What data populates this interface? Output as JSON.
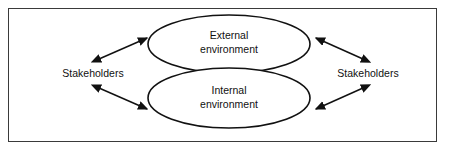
{
  "figure": {
    "background_color": "#ffffff",
    "frame_color": "#3a3a3a",
    "stroke_color": "#111111"
  },
  "diagram": {
    "type": "venn-overlap-with-bidirectional-arrows",
    "ellipses": [
      {
        "id": "external",
        "label_line1": "External",
        "label_line2": "environment",
        "cx": 229,
        "cy": 44,
        "rx": 81,
        "ry": 29
      },
      {
        "id": "internal",
        "label_line1": "Internal",
        "label_line2": "environment",
        "cx": 229,
        "cy": 98,
        "rx": 81,
        "ry": 30
      }
    ],
    "side_labels": [
      {
        "id": "stakeholders-left",
        "text": "Stakeholders",
        "x": 93,
        "y": 74
      },
      {
        "id": "stakeholders-right",
        "text": "Stakeholders",
        "x": 368,
        "y": 74
      }
    ],
    "arrows": [
      {
        "id": "left-upper",
        "x1": 99,
        "y1": 59,
        "x2": 147,
        "y2": 38,
        "double_headed": true
      },
      {
        "id": "left-lower",
        "x1": 99,
        "y1": 88,
        "x2": 147,
        "y2": 109,
        "double_headed": true
      },
      {
        "id": "right-upper",
        "x1": 363,
        "y1": 59,
        "x2": 316,
        "y2": 38,
        "double_headed": true
      },
      {
        "id": "right-lower",
        "x1": 363,
        "y1": 88,
        "x2": 316,
        "y2": 109,
        "double_headed": true
      }
    ]
  }
}
